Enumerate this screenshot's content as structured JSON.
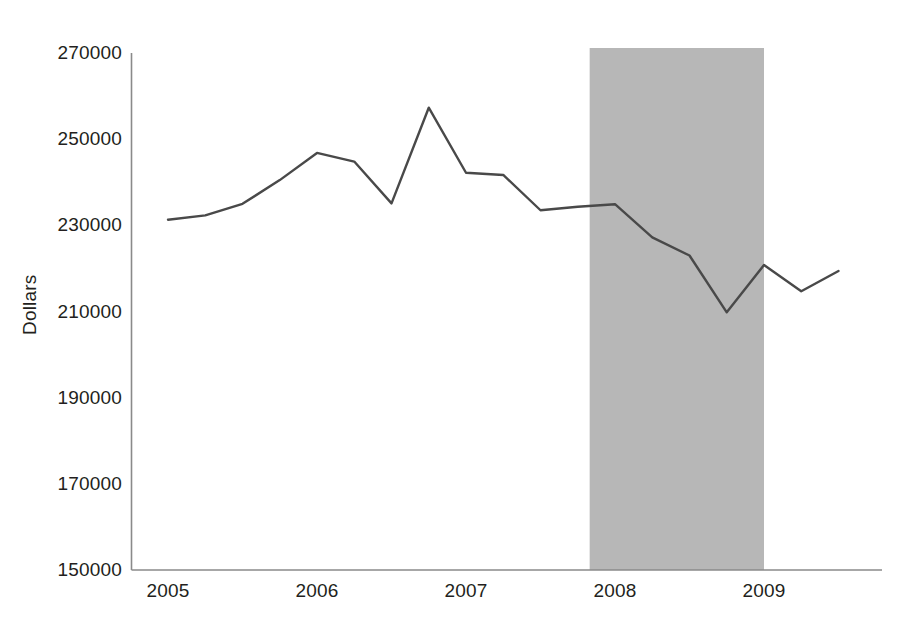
{
  "chart_data": {
    "type": "line",
    "title": "",
    "subtitle": "",
    "xlabel": "",
    "ylabel": "Dollars",
    "grid": false,
    "legend": false,
    "legend_position": "none",
    "xlim": [
      2004.875,
      2009.875
    ],
    "ylim": [
      150000,
      270000
    ],
    "y_ticks": [
      150000,
      170000,
      190000,
      210000,
      230000,
      250000,
      270000
    ],
    "y_tick_labels": [
      "150000",
      "170000",
      "190000",
      "210000",
      "230000",
      "250000",
      "270000"
    ],
    "x_ticks": [
      2005,
      2006,
      2007,
      2008,
      2009
    ],
    "x_tick_labels": [
      "2005",
      "2006",
      "2007",
      "2008",
      "2009"
    ],
    "line_color": "#494949",
    "line_width": 2.4,
    "x": [
      2005.0,
      2005.25,
      2005.5,
      2005.75,
      2006.0,
      2006.25,
      2006.5,
      2006.75,
      2007.0,
      2007.25,
      2007.5,
      2007.75,
      2008.0,
      2008.25,
      2008.5,
      2008.75,
      2009.0,
      2009.25,
      2009.5
    ],
    "values": [
      231300,
      232300,
      235000,
      240500,
      246800,
      244800,
      235100,
      257300,
      242200,
      241700,
      233500,
      234300,
      234900,
      227200,
      223000,
      209800,
      220800,
      214700,
      219400
    ],
    "x_point_labels": [
      "2005 Q1",
      "2005 Q2",
      "2005 Q3",
      "2005 Q4",
      "2006 Q1",
      "2006 Q2",
      "2006 Q3",
      "2006 Q4",
      "2007 Q1",
      "2007 Q2",
      "2007 Q3",
      "2007 Q4",
      "2008 Q1",
      "2008 Q2",
      "2008 Q3",
      "2008 Q4",
      "2009 Q1",
      "2009 Q2",
      "2009 Q3"
    ],
    "shaded_region": {
      "name": "recession-band",
      "color": "#b7b7b7",
      "x_start": 2007.83,
      "x_end": 2009.0,
      "y_start": 150000,
      "y_end": 270000
    }
  },
  "axes": {
    "y_title": "Dollars",
    "y_tick_labels": [
      "270000",
      "250000",
      "230000",
      "210000",
      "190000",
      "170000",
      "150000"
    ],
    "x_tick_labels": [
      "2005",
      "2006",
      "2007",
      "2008",
      "2009"
    ]
  },
  "colors": {
    "line": "#494949",
    "axis": "#808080",
    "band": "#b7b7b7",
    "text": "#231f20",
    "background": "#ffffff"
  }
}
